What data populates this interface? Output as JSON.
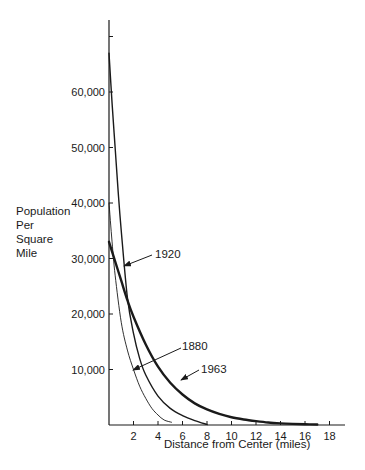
{
  "chart_data": {
    "type": "line",
    "title": "",
    "xlabel": "Distance from Center (miles)",
    "ylabel": "Population Per Square Mile",
    "ylabel_lines": [
      "Population",
      "Per",
      "Square",
      "Mile"
    ],
    "xlim": [
      0,
      19
    ],
    "ylim": [
      0,
      72000
    ],
    "x_ticks": [
      2,
      4,
      6,
      8,
      10,
      12,
      14,
      16,
      18
    ],
    "x_tick_labels": [
      "2",
      "4",
      "6",
      "8",
      "10",
      "12",
      "14",
      "16",
      "18"
    ],
    "y_ticks": [
      10000,
      20000,
      30000,
      40000,
      50000,
      60000,
      70000
    ],
    "y_tick_labels": [
      "10,000",
      "20,000",
      "30,000",
      "40,000",
      "50,000",
      "60,000",
      ""
    ],
    "grid": false,
    "legend": "inline annotations with arrows",
    "series": [
      {
        "name": "1880",
        "stroke_width": 0.9,
        "x": [
          0,
          0.25,
          0.5,
          1,
          1.5,
          2,
          2.5,
          3,
          3.5,
          4,
          4.5,
          5.1
        ],
        "values": [
          40000,
          33000,
          27000,
          18500,
          13500,
          10000,
          7000,
          4800,
          3000,
          1800,
          900,
          500
        ]
      },
      {
        "name": "1920",
        "stroke_width": 1.4,
        "x": [
          0,
          0.25,
          0.5,
          0.75,
          1,
          1.5,
          2,
          2.5,
          3,
          4,
          5,
          6,
          7,
          8
        ],
        "values": [
          67000,
          58000,
          50000,
          42000,
          35000,
          23000,
          16500,
          12000,
          9000,
          5200,
          3000,
          1700,
          800,
          100
        ]
      },
      {
        "name": "1963",
        "stroke_width": 2.4,
        "x": [
          0,
          0.5,
          1,
          1.5,
          2,
          3,
          4,
          5,
          6,
          7,
          8,
          9,
          10,
          11,
          12,
          13,
          14,
          15,
          16,
          17
        ],
        "values": [
          33000,
          29500,
          26000,
          22500,
          19500,
          14500,
          10500,
          7600,
          5500,
          3900,
          2800,
          2000,
          1400,
          1000,
          700,
          450,
          300,
          200,
          130,
          80
        ]
      }
    ],
    "annotations": [
      {
        "text": "1880",
        "points_to_series": "1880"
      },
      {
        "text": "1920",
        "points_to_series": "1920"
      },
      {
        "text": "1963",
        "points_to_series": "1963"
      }
    ]
  }
}
